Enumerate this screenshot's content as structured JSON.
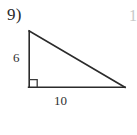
{
  "page": {
    "background_color": "#ffffff",
    "width": 137,
    "height": 135
  },
  "problem": {
    "number_label": "9)",
    "next_number_partial": "1"
  },
  "figure": {
    "name": "right-triangle",
    "stroke_color": "#2b2b2b",
    "stroke_width": 1.6,
    "right_angle_marker": true,
    "vertices": {
      "apex": [
        29,
        31
      ],
      "right_angle": [
        29,
        87
      ],
      "base_right": [
        125,
        87
      ]
    },
    "labels": {
      "vertical_leg": "6",
      "horizontal_leg": "10"
    }
  }
}
